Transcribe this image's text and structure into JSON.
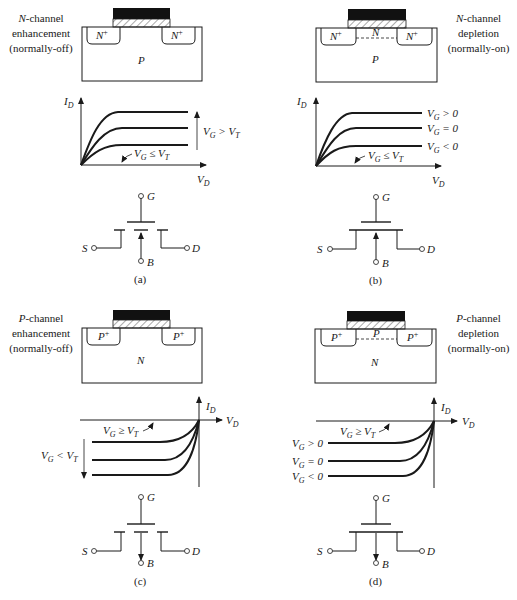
{
  "figure": {
    "panels": [
      {
        "id": "a",
        "caption": "(a)",
        "type_italic": "N",
        "type_rest": "-channel",
        "mode": "enhancement",
        "behavior": "(normally-off)",
        "substrate": "P",
        "source_region": "N+",
        "drain_region": "N+",
        "channel": "",
        "curve_labels": [
          "V_G > V_T",
          "V_G ≤ V_T"
        ],
        "axes": {
          "y": "I_D",
          "x": "V_D"
        },
        "symbol": {
          "gate": "G",
          "source": "S",
          "drain": "D",
          "body": "B",
          "channel": "broken",
          "body_arrow": "inward"
        }
      },
      {
        "id": "b",
        "caption": "(b)",
        "type_italic": "N",
        "type_rest": "-channel",
        "mode": "depletion",
        "behavior": "(normally-on)",
        "substrate": "P",
        "source_region": "N+",
        "drain_region": "N+",
        "channel": "N",
        "curve_labels": [
          "V_G > 0",
          "V_G = 0",
          "V_G < 0",
          "V_G ≤ V_T"
        ],
        "axes": {
          "y": "I_D",
          "x": "V_D"
        },
        "symbol": {
          "gate": "G",
          "source": "S",
          "drain": "D",
          "body": "B",
          "channel": "solid",
          "body_arrow": "inward"
        }
      },
      {
        "id": "c",
        "caption": "(c)",
        "type_italic": "P",
        "type_rest": "-channel",
        "mode": "enhancement",
        "behavior": "(normally-off)",
        "substrate": "N",
        "source_region": "P+",
        "drain_region": "P+",
        "channel": "",
        "curve_labels": [
          "V_G ≥ V_T",
          "V_G < V_T"
        ],
        "axes": {
          "y": "I_D",
          "x": "V_D"
        },
        "symbol": {
          "gate": "G",
          "source": "S",
          "drain": "D",
          "body": "B",
          "channel": "broken",
          "body_arrow": "outward"
        }
      },
      {
        "id": "d",
        "caption": "(d)",
        "type_italic": "P",
        "type_rest": "-channel",
        "mode": "depletion",
        "behavior": "(normally-on)",
        "substrate": "N",
        "source_region": "P+",
        "drain_region": "P+",
        "channel": "P",
        "curve_labels": [
          "V_G ≥ V_T",
          "V_G > 0",
          "V_G = 0",
          "V_G < 0"
        ],
        "axes": {
          "y": "I_D",
          "x": "V_D"
        },
        "symbol": {
          "gate": "G",
          "source": "S",
          "drain": "D",
          "body": "B",
          "channel": "solid",
          "body_arrow": "outward"
        }
      }
    ]
  }
}
